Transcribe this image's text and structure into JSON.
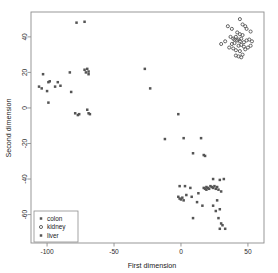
{
  "chart_data": {
    "type": "scatter",
    "title": "",
    "xlabel": "First dimension",
    "ylabel": "Second dimension",
    "xlim": [
      -112,
      62
    ],
    "ylim": [
      -76,
      54
    ],
    "xticks": [
      -100,
      -50,
      0,
      50
    ],
    "xticklabels": [
      "-100",
      "-50",
      "0",
      "50"
    ],
    "yticks": [
      40,
      20,
      0,
      -20,
      -40,
      -60
    ],
    "yticklabels": [
      "40",
      "20",
      "0",
      "-20",
      "-40",
      "-60"
    ],
    "grid": false,
    "legend_position": "bottom-left",
    "marker_color": "#555555",
    "frame_color": "#8d8d8d",
    "series": [
      {
        "name": "colon",
        "marker": "square",
        "color": "#555555",
        "points": [
          [
            -78,
            48
          ],
          [
            -72,
            48.5
          ],
          [
            -103,
            19
          ],
          [
            -106,
            12
          ],
          [
            -104,
            11
          ],
          [
            -99,
            14.5
          ],
          [
            -98,
            15
          ],
          [
            -100,
            9.5
          ],
          [
            -99,
            3
          ],
          [
            -94,
            12
          ],
          [
            -92,
            14.5
          ],
          [
            -90,
            12.5
          ],
          [
            -83,
            20
          ],
          [
            -82,
            9
          ],
          [
            -79,
            -3
          ],
          [
            -77,
            -4
          ],
          [
            -76,
            -3.5
          ],
          [
            -72,
            21.5
          ],
          [
            -71,
            20
          ],
          [
            -70,
            22
          ],
          [
            -69,
            20.5
          ],
          [
            -69,
            19
          ],
          [
            -70,
            -1
          ],
          [
            -69,
            -3
          ],
          [
            -68,
            -3.5
          ],
          [
            -27,
            22
          ],
          [
            -23,
            11
          ],
          [
            -2,
            -3.5
          ],
          [
            -12,
            -17.5
          ]
        ]
      },
      {
        "name": "kidney",
        "marker": "circle",
        "color": "#555555",
        "points": [
          [
            35,
            46
          ],
          [
            38,
            44.5
          ],
          [
            44,
            50
          ],
          [
            46,
            47
          ],
          [
            48,
            46
          ],
          [
            49,
            44.5
          ],
          [
            52,
            43
          ],
          [
            42,
            42.5
          ],
          [
            44,
            41.5
          ],
          [
            46,
            41
          ],
          [
            33,
            37.5
          ],
          [
            37,
            40
          ],
          [
            39,
            39
          ],
          [
            40,
            38.5
          ],
          [
            41,
            40
          ],
          [
            42,
            38
          ],
          [
            43,
            38.5
          ],
          [
            44,
            37.5
          ],
          [
            45,
            39
          ],
          [
            47,
            37
          ],
          [
            49,
            38
          ],
          [
            51,
            38.5
          ],
          [
            53,
            37.5
          ],
          [
            38,
            36
          ],
          [
            40,
            36.5
          ],
          [
            43,
            35
          ],
          [
            45,
            35.5
          ],
          [
            47,
            34.5
          ],
          [
            50,
            34
          ],
          [
            52,
            35
          ],
          [
            30,
            36
          ],
          [
            41,
            32.5
          ],
          [
            44,
            32
          ],
          [
            41,
            29.5
          ],
          [
            43,
            29
          ],
          [
            45,
            28.5
          ],
          [
            48,
            33
          ],
          [
            36,
            34
          ],
          [
            39,
            33.5
          ],
          [
            46,
            30
          ]
        ]
      },
      {
        "name": "liver",
        "marker": "square",
        "color": "#555555",
        "points": [
          [
            2,
            -17
          ],
          [
            9,
            -25.5
          ],
          [
            15,
            -17
          ],
          [
            17,
            -26.5
          ],
          [
            18,
            -27
          ],
          [
            24,
            -40
          ],
          [
            22,
            -44
          ],
          [
            23,
            -44.5
          ],
          [
            24,
            -45
          ],
          [
            25,
            -44
          ],
          [
            26,
            -45.5
          ],
          [
            27,
            -44.5
          ],
          [
            20,
            -45
          ],
          [
            21,
            -45.5
          ],
          [
            19,
            -46
          ],
          [
            29,
            -40.5
          ],
          [
            32,
            -40
          ],
          [
            28,
            -46
          ],
          [
            30,
            -47
          ],
          [
            3,
            -44
          ],
          [
            -1,
            -44
          ],
          [
            -2,
            -50
          ],
          [
            -1,
            -51
          ],
          [
            0,
            -51.5
          ],
          [
            1,
            -50.5
          ],
          [
            2,
            -52
          ],
          [
            4,
            -49
          ],
          [
            8,
            -50
          ],
          [
            7,
            -45
          ],
          [
            13,
            -48
          ],
          [
            12,
            -53
          ],
          [
            16,
            -55
          ],
          [
            9,
            -62
          ],
          [
            24,
            -55
          ],
          [
            27,
            -52
          ],
          [
            29,
            -57
          ],
          [
            28,
            -62
          ],
          [
            30,
            -65
          ],
          [
            31,
            -66
          ],
          [
            29,
            -68
          ],
          [
            33,
            -68
          ],
          [
            26,
            -58
          ],
          [
            17,
            -45
          ],
          [
            18,
            -45.5
          ],
          [
            19,
            -44.5
          ]
        ]
      }
    ]
  },
  "legend": {
    "items": [
      {
        "label": "colon"
      },
      {
        "label": "kidney"
      },
      {
        "label": "liver"
      }
    ]
  }
}
